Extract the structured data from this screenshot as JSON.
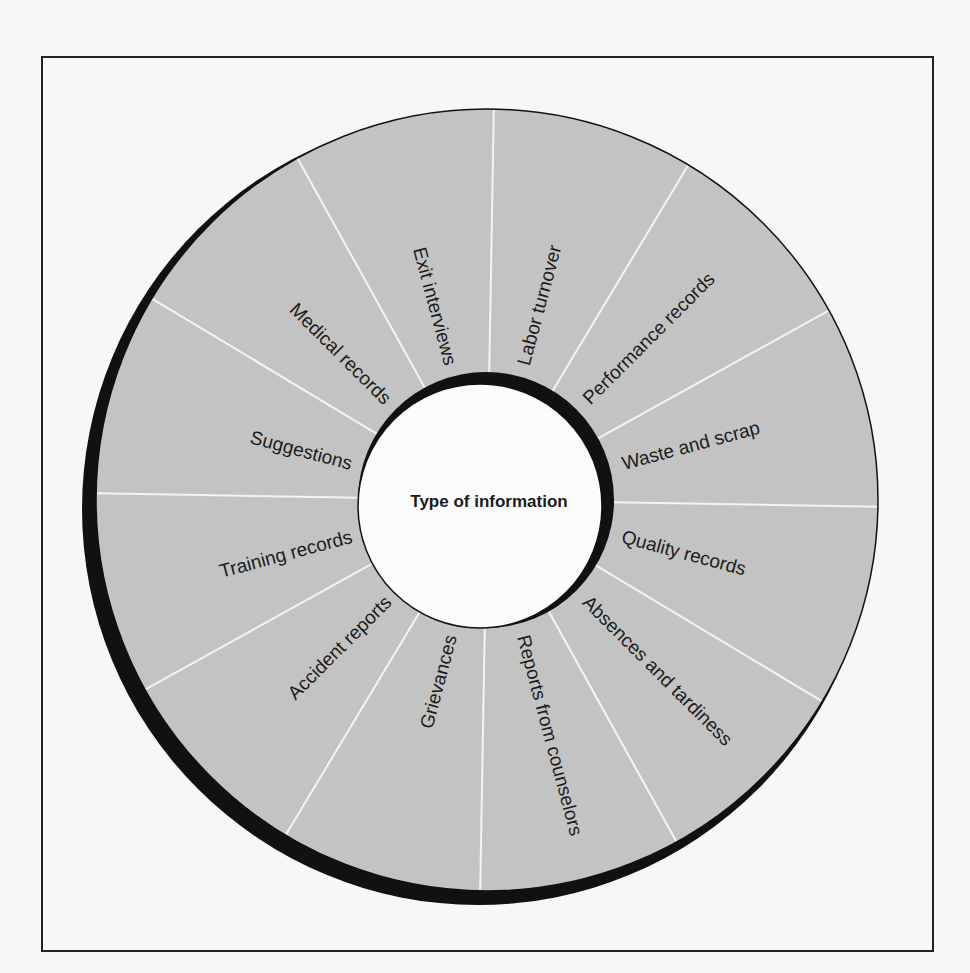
{
  "diagram": {
    "center_label": "Type of information",
    "segments": [
      {
        "label": "Labor turnover"
      },
      {
        "label": "Performance records"
      },
      {
        "label": "Waste and scrap"
      },
      {
        "label": "Quality records"
      },
      {
        "label": "Absences and tardiness"
      },
      {
        "label": "Reports from counselors"
      },
      {
        "label": "Grievances"
      },
      {
        "label": "Accident reports"
      },
      {
        "label": "Training records"
      },
      {
        "label": "Suggestions"
      },
      {
        "label": "Medical records"
      },
      {
        "label": "Exit interviews"
      }
    ],
    "colors": {
      "ring_fill": "#c3c3c3",
      "spoke": "#f4f4f4",
      "shadow": "#111111",
      "hub_fill": "#fbfbfb",
      "text": "#1c1c1c"
    }
  }
}
